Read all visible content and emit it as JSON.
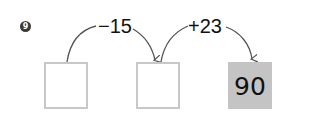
{
  "problem": {
    "number": "9",
    "operations": [
      {
        "label": "−15",
        "from_box": 1,
        "to_box": 2
      },
      {
        "label": "+23",
        "from_box": 2,
        "to_box": 3
      }
    ],
    "boxes": [
      {
        "value": "",
        "filled": false
      },
      {
        "value": "",
        "filled": false
      },
      {
        "value": "90",
        "filled": true
      }
    ]
  },
  "colors": {
    "box_border": "#c8c8c8",
    "filled_box": "#c4c4c4",
    "arrow": "#555555",
    "marker": "#3a3a3a"
  }
}
